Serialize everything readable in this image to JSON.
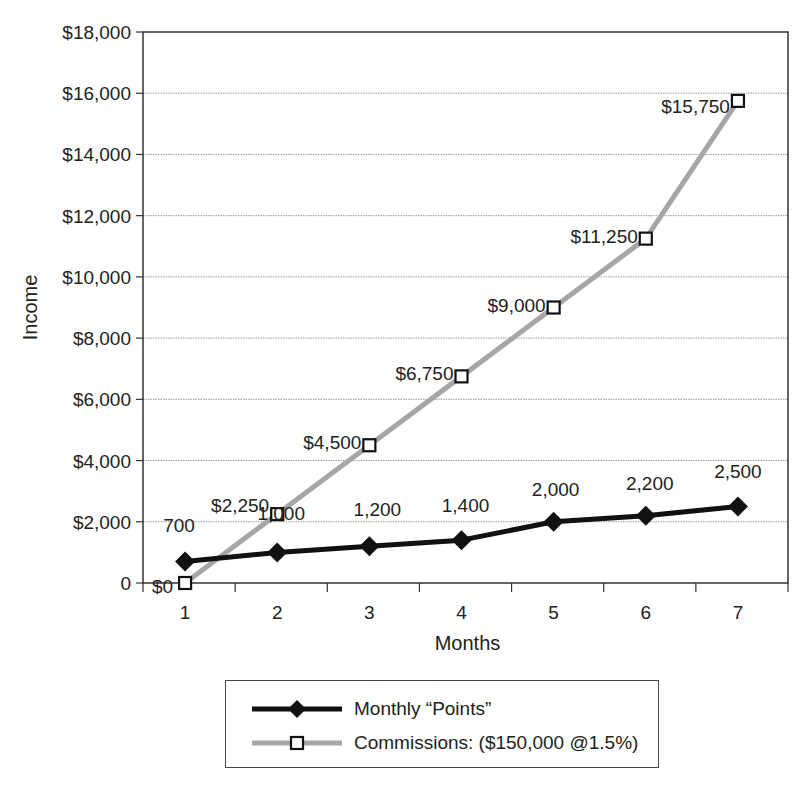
{
  "chart_data": {
    "type": "line",
    "title": "",
    "title_fragment_visible": "...g...y...",
    "xlabel": "Months",
    "ylabel": "Income",
    "categories": [
      "1",
      "2",
      "3",
      "4",
      "5",
      "6",
      "7"
    ],
    "ylim": [
      0,
      18000
    ],
    "y_ticks": [
      0,
      2000,
      4000,
      6000,
      8000,
      10000,
      12000,
      14000,
      16000,
      18000
    ],
    "y_tick_labels": [
      "0",
      "$2,000",
      "$4,000",
      "$6,000",
      "$8,000",
      "$10,000",
      "$12,000",
      "$14,000",
      "$16,000",
      "$18,000"
    ],
    "grid": true,
    "legend_position": "bottom",
    "series": [
      {
        "name": "Monthly “Points”",
        "values": [
          700,
          1000,
          1200,
          1400,
          2000,
          2200,
          2500
        ],
        "data_labels": [
          "700",
          "1,000",
          "1,200",
          "1,400",
          "2,000",
          "2,200",
          "2,500"
        ],
        "color": "#111111",
        "marker": "filled-diamond",
        "line_width": 5
      },
      {
        "name": "Commissions: ($150,000 @1.5%)",
        "values": [
          0,
          2250,
          4500,
          6750,
          9000,
          11250,
          15750
        ],
        "data_labels": [
          "$0",
          "$2,250",
          "$4,500",
          "$6,750",
          "$9,000",
          "$11,250",
          "$15,750"
        ],
        "color": "#a6a6a6",
        "marker": "hollow-square",
        "line_width": 5
      }
    ]
  },
  "legend": {
    "items": [
      {
        "label": "Monthly “Points”"
      },
      {
        "label": "Commissions: ($150,000 @1.5%)"
      }
    ]
  }
}
